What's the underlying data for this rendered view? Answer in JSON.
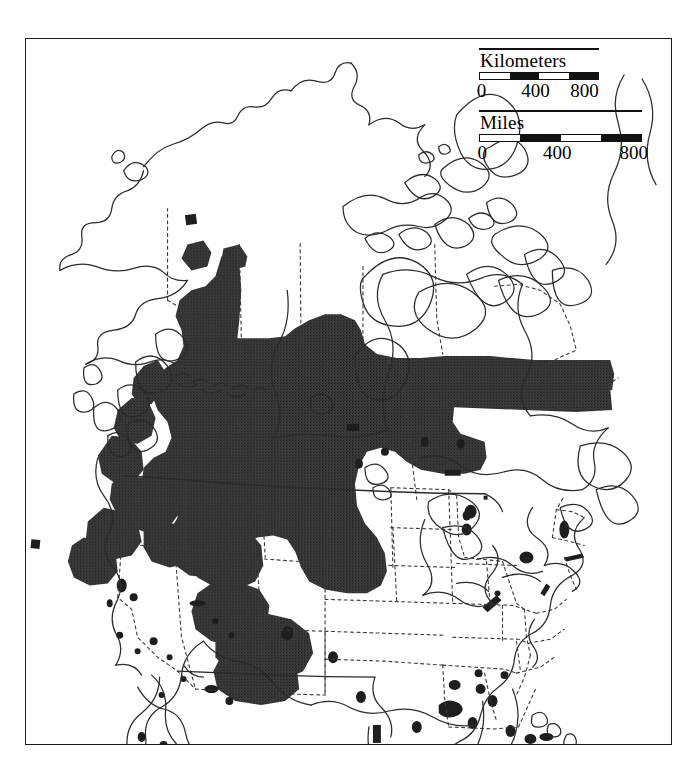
{
  "figure": {
    "type": "distribution-range-map",
    "region": "North America",
    "projection": "conic",
    "background_color": "#ffffff",
    "frame_color": "#1a1a1a",
    "coastline_color": "#2b2b2b",
    "political_border_style": "dashed",
    "range_fill_color": "#3a3a3a",
    "range_description": "Continuous shaded distribution across western Canada and the western United States, with numerous small disjunct populations scattered through California, the Great Basin, the southern Great Plains, the Great Lakes and the northeastern United States."
  },
  "scales": {
    "kilometers": {
      "title": "Kilometers",
      "unit": "Kilometers",
      "ticks": [
        "0",
        "400",
        "800"
      ],
      "segments": [
        "light",
        "dark",
        "light",
        "dark"
      ],
      "min": 0,
      "max": 800,
      "interval": 200
    },
    "miles": {
      "title": "Miles",
      "unit": "Miles",
      "ticks": [
        "0",
        "400",
        "800"
      ],
      "segments": [
        "light",
        "dark",
        "light",
        "dark"
      ],
      "min": 0,
      "max": 800,
      "interval": 200
    }
  }
}
